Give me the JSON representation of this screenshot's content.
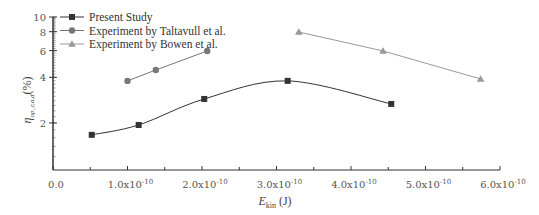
{
  "chart_data": {
    "type": "line",
    "title": "",
    "xlabel": "E_kin (J)",
    "xlabel_main": "E",
    "xlabel_sub": "kin",
    "xlabel_unit": " (J)",
    "ylabel": "η_op_r,a,d (%)",
    "ylabel_main": "η",
    "ylabel_sub": "op_r,a,d",
    "ylabel_unit": "(%)",
    "yscale": "log",
    "xlim": [
      0,
      6e-10
    ],
    "ylim": [
      1,
      10
    ],
    "x_ticks": [
      {
        "value": 0,
        "label": "0.0"
      },
      {
        "value": 1e-10,
        "label": "1.0x10",
        "exp": "-10"
      },
      {
        "value": 2e-10,
        "label": "2.0x10",
        "exp": "-10"
      },
      {
        "value": 3e-10,
        "label": "3.0x10",
        "exp": "-10"
      },
      {
        "value": 4e-10,
        "label": "4.0x10",
        "exp": "-10"
      },
      {
        "value": 5e-10,
        "label": "5.0x10",
        "exp": "-10"
      },
      {
        "value": 6e-10,
        "label": "6.0x10",
        "exp": "-10"
      }
    ],
    "y_ticks": [
      {
        "value": 2,
        "label": "2"
      },
      {
        "value": 4,
        "label": "4"
      },
      {
        "value": 6,
        "label": "6"
      },
      {
        "value": 8,
        "label": "8"
      },
      {
        "value": 10,
        "label": "10"
      }
    ],
    "legend_position": "upper-left",
    "grid": false,
    "series": [
      {
        "name": "Present Study",
        "marker": "square",
        "color": "#333333",
        "smooth": true,
        "x": [
          5.2e-11,
          1.15e-10,
          2.03e-10,
          3.15e-10,
          4.54e-10
        ],
        "y": [
          1.67,
          1.94,
          2.88,
          3.79,
          2.67
        ]
      },
      {
        "name": "Experiment by Taltavull et al.",
        "marker": "circle",
        "color": "#777777",
        "smooth": false,
        "x": [
          1e-10,
          1.38e-10,
          2.07e-10
        ],
        "y": [
          3.79,
          4.47,
          5.97
        ]
      },
      {
        "name": "Experiment by Bowen et al.",
        "marker": "triangle",
        "color": "#999999",
        "smooth": false,
        "x": [
          3.3e-10,
          4.43e-10,
          5.74e-10
        ],
        "y": [
          7.96,
          5.97,
          3.9
        ]
      }
    ]
  }
}
